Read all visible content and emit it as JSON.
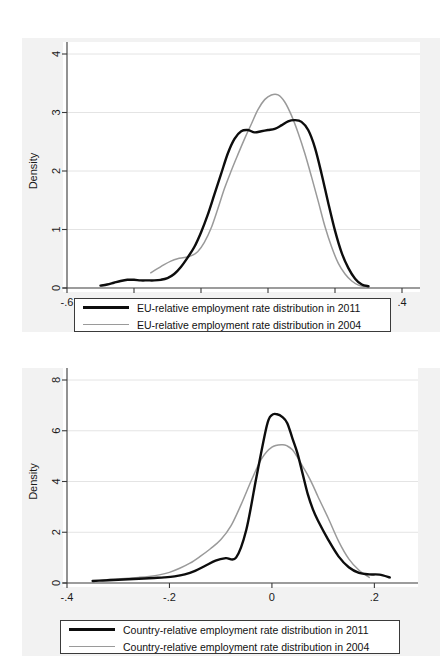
{
  "figure": {
    "background_color": "#f2f2f2",
    "plot_background_color": "#ffffff",
    "series_2011_color": "#0d0d0d",
    "series_2004_color": "#9a9a9a"
  },
  "chart_data": [
    {
      "id": "eu-relative-density",
      "type": "line",
      "title": "",
      "subtitle": "",
      "xlabel": "",
      "ylabel": "Density",
      "xlim": [
        -0.6,
        0.4
      ],
      "ylim": [
        0,
        4
      ],
      "xticks": [
        -0.6,
        -0.4,
        -0.2,
        0,
        0.2,
        0.4
      ],
      "xticklabels": [
        "-.6",
        "-.4",
        "-.2",
        "0",
        ".2",
        ".4"
      ],
      "yticks": [
        0,
        1,
        2,
        3,
        4
      ],
      "yticklabels": [
        "0",
        "1",
        "2",
        "3",
        "4"
      ],
      "grid": "horizontal",
      "legend_position": "below-axes",
      "series": [
        {
          "name": "EU-relative employment rate distribution in 2011",
          "color": "#0d0d0d",
          "linewidth": "thick",
          "x": [
            -0.5,
            -0.48,
            -0.46,
            -0.44,
            -0.42,
            -0.4,
            -0.38,
            -0.36,
            -0.34,
            -0.32,
            -0.3,
            -0.28,
            -0.26,
            -0.24,
            -0.22,
            -0.2,
            -0.18,
            -0.16,
            -0.14,
            -0.12,
            -0.1,
            -0.08,
            -0.06,
            -0.04,
            -0.02,
            0.0,
            0.02,
            0.04,
            0.06,
            0.08,
            0.1,
            0.12,
            0.14,
            0.16,
            0.18,
            0.2,
            0.22,
            0.24,
            0.26,
            0.28,
            0.3
          ],
          "y": [
            0.04,
            0.06,
            0.09,
            0.12,
            0.14,
            0.14,
            0.13,
            0.13,
            0.13,
            0.14,
            0.17,
            0.24,
            0.36,
            0.52,
            0.7,
            0.95,
            1.25,
            1.6,
            1.95,
            2.3,
            2.55,
            2.68,
            2.7,
            2.66,
            2.68,
            2.7,
            2.72,
            2.78,
            2.85,
            2.87,
            2.84,
            2.7,
            2.4,
            1.95,
            1.45,
            0.98,
            0.6,
            0.34,
            0.16,
            0.06,
            0.03
          ]
        },
        {
          "name": "EU-relative employment rate distribution in 2004",
          "color": "#9a9a9a",
          "linewidth": "thin",
          "x": [
            -0.35,
            -0.33,
            -0.31,
            -0.29,
            -0.27,
            -0.25,
            -0.23,
            -0.21,
            -0.19,
            -0.17,
            -0.15,
            -0.13,
            -0.11,
            -0.09,
            -0.07,
            -0.05,
            -0.03,
            -0.01,
            0.01,
            0.03,
            0.05,
            0.07,
            0.09,
            0.11,
            0.13,
            0.15,
            0.17,
            0.19,
            0.21,
            0.23,
            0.25,
            0.27,
            0.29
          ],
          "y": [
            0.26,
            0.33,
            0.4,
            0.46,
            0.5,
            0.52,
            0.55,
            0.62,
            0.78,
            1.02,
            1.35,
            1.7,
            2.0,
            2.28,
            2.55,
            2.8,
            3.05,
            3.22,
            3.3,
            3.3,
            3.18,
            2.95,
            2.65,
            2.3,
            1.9,
            1.48,
            1.05,
            0.7,
            0.42,
            0.24,
            0.12,
            0.05,
            0.02
          ]
        }
      ]
    },
    {
      "id": "country-relative-density",
      "type": "line",
      "title": "",
      "subtitle": "",
      "xlabel": "",
      "ylabel": "Density",
      "xlim": [
        -0.4,
        0.25
      ],
      "ylim": [
        0,
        8
      ],
      "xticks": [
        -0.4,
        -0.2,
        0,
        0.2
      ],
      "xticklabels": [
        "-.4",
        "-.2",
        "0",
        ".2"
      ],
      "yticks": [
        0,
        2,
        4,
        6,
        8
      ],
      "yticklabels": [
        "0",
        "2",
        "4",
        "6",
        "8"
      ],
      "grid": "horizontal",
      "legend_position": "below-axes",
      "series": [
        {
          "name": "Country-relative employment rate distribution in 2011",
          "color": "#0d0d0d",
          "linewidth": "thick",
          "x": [
            -0.35,
            -0.33,
            -0.31,
            -0.29,
            -0.27,
            -0.25,
            -0.23,
            -0.21,
            -0.19,
            -0.17,
            -0.15,
            -0.13,
            -0.11,
            -0.09,
            -0.07,
            -0.05,
            -0.03,
            -0.01,
            0.0,
            0.01,
            0.02,
            0.03,
            0.04,
            0.05,
            0.06,
            0.07,
            0.08,
            0.09,
            0.11,
            0.13,
            0.15,
            0.17,
            0.19,
            0.21,
            0.23
          ],
          "y": [
            0.08,
            0.1,
            0.12,
            0.14,
            0.16,
            0.18,
            0.2,
            0.22,
            0.26,
            0.34,
            0.48,
            0.68,
            0.88,
            0.98,
            1.0,
            2.1,
            4.2,
            6.2,
            6.62,
            6.65,
            6.55,
            6.3,
            5.7,
            5.1,
            4.3,
            3.5,
            2.9,
            2.45,
            1.7,
            1.05,
            0.62,
            0.4,
            0.34,
            0.33,
            0.22
          ]
        },
        {
          "name": "Country-relative employment rate distribution in 2004",
          "color": "#9a9a9a",
          "linewidth": "thin",
          "x": [
            -0.32,
            -0.3,
            -0.28,
            -0.26,
            -0.24,
            -0.22,
            -0.2,
            -0.18,
            -0.16,
            -0.14,
            -0.12,
            -0.1,
            -0.08,
            -0.06,
            -0.04,
            -0.02,
            0.0,
            0.02,
            0.03,
            0.04,
            0.05,
            0.06,
            0.07,
            0.08,
            0.09,
            0.11,
            0.13,
            0.15,
            0.17,
            0.19
          ],
          "y": [
            0.14,
            0.16,
            0.19,
            0.22,
            0.26,
            0.32,
            0.42,
            0.58,
            0.78,
            1.05,
            1.35,
            1.7,
            2.25,
            3.1,
            4.05,
            4.9,
            5.35,
            5.45,
            5.4,
            5.25,
            4.95,
            4.6,
            4.25,
            3.85,
            3.4,
            2.55,
            1.65,
            0.95,
            0.5,
            0.22
          ]
        }
      ]
    }
  ],
  "charts": {
    "top": {
      "ylabel": "Density",
      "xticklabels": [
        "-.6",
        "-.4",
        "-.2",
        "0",
        ".2",
        ".4"
      ],
      "yticklabels": [
        "0",
        "1",
        "2",
        "3",
        "4"
      ],
      "legend": {
        "items": [
          {
            "label": "EU-relative employment rate distribution in 2011",
            "style": "thick-black"
          },
          {
            "label": "EU-relative employment rate distribution in 2004",
            "style": "thin-gray"
          }
        ]
      }
    },
    "bottom": {
      "ylabel": "Density",
      "xticklabels": [
        "-.4",
        "-.2",
        "0",
        ".2"
      ],
      "yticklabels": [
        "0",
        "2",
        "4",
        "6",
        "8"
      ],
      "legend": {
        "items": [
          {
            "label": "Country-relative employment rate distribution in 2011",
            "style": "thick-black"
          },
          {
            "label": "Country-relative employment rate distribution in 2004",
            "style": "thin-gray"
          }
        ]
      }
    }
  }
}
